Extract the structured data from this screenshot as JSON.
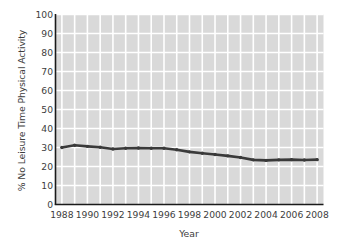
{
  "chart_data": {
    "type": "line",
    "title": "",
    "xlabel": "Year",
    "ylabel": "% No Leisure Time Physical Activity",
    "xlim": [
      1987.5,
      2008.5
    ],
    "ylim": [
      0,
      100
    ],
    "grid": true,
    "legend": "none",
    "x_tick_labels": [
      "1988",
      "1990",
      "1992",
      "1994",
      "1996",
      "1998",
      "2000",
      "2002",
      "2004",
      "2006",
      "2008"
    ],
    "x_tick_values": [
      1988,
      1990,
      1992,
      1994,
      1996,
      1998,
      2000,
      2002,
      2004,
      2006,
      2008
    ],
    "y_tick_labels": [
      "0",
      "10",
      "20",
      "30",
      "40",
      "50",
      "60",
      "70",
      "80",
      "90",
      "100"
    ],
    "y_tick_values": [
      0,
      10,
      20,
      30,
      40,
      50,
      60,
      70,
      80,
      90,
      100
    ],
    "x": [
      1988,
      1989,
      1990,
      1991,
      1992,
      1993,
      1994,
      1995,
      1996,
      1997,
      1998,
      1999,
      2000,
      2001,
      2002,
      2003,
      2004,
      2005,
      2006,
      2007,
      2008
    ],
    "series": [
      {
        "name": "% No Leisure Time Physical Activity",
        "color": "#3a3a3a",
        "marker": "circle",
        "values": [
          30.0,
          31.2,
          30.6,
          30.1,
          29.2,
          29.6,
          29.7,
          29.6,
          29.6,
          28.8,
          27.7,
          27.0,
          26.3,
          25.6,
          24.7,
          23.5,
          23.2,
          23.5,
          23.6,
          23.4,
          23.6
        ]
      }
    ]
  },
  "plot_style": {
    "plot_background": "#d9d9d9",
    "gridline_color": "#ffffff",
    "axis_color": "#1a1a1a",
    "text_color": "#3d3d3d"
  }
}
